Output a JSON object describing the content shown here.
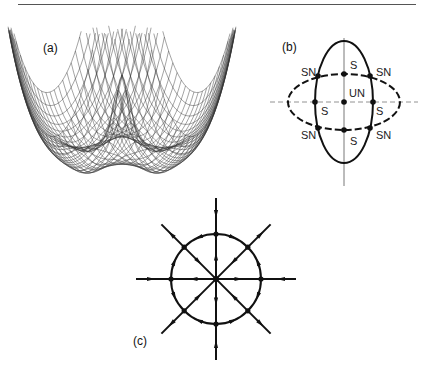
{
  "figure": {
    "top_rule": true,
    "panels": [
      {
        "id": "a",
        "label": "(a)",
        "type": "wireframe-surface",
        "description": "3D wireframe plot of a double-well-like potential surface with a central peak and four side wells"
      },
      {
        "id": "b",
        "label": "(b)",
        "type": "ellipses-with-fixed-points",
        "solid_ellipse": {
          "cx": 344,
          "cy": 102,
          "rx": 29,
          "ry": 61
        },
        "dashed_ellipse": {
          "cx": 344,
          "cy": 102,
          "rx": 56,
          "ry": 28
        },
        "axes": {
          "vertical": {
            "x": 344,
            "y1": 38,
            "y2": 186
          },
          "horizontal_dashed": {
            "y": 102,
            "x1": 270,
            "x2": 418
          }
        },
        "point_labels": {
          "center": "UN",
          "on_axes": [
            "S",
            "S",
            "S",
            "S"
          ],
          "intersections": [
            "SN",
            "SN",
            "SN",
            "SN"
          ]
        }
      },
      {
        "id": "c",
        "label": "(c)",
        "type": "phase-portrait",
        "center": {
          "x": 216,
          "y": 279
        },
        "circle_radius": 45,
        "ray_length": 80,
        "diagonal_length": 70
      }
    ]
  }
}
